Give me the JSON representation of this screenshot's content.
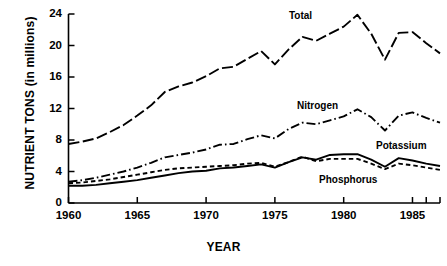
{
  "chart_data": {
    "type": "line",
    "title": "",
    "xlabel": "YEAR",
    "ylabel": "NUTRIENT TONS (in millions)",
    "xlim": [
      1960,
      1987
    ],
    "ylim": [
      0,
      24
    ],
    "xticks": [
      1960,
      1965,
      1970,
      1975,
      1980,
      1985
    ],
    "yticks": [
      0,
      4,
      8,
      12,
      16,
      20,
      24
    ],
    "grid": false,
    "legend": "inline-annotations",
    "x": [
      1960,
      1961,
      1962,
      1963,
      1964,
      1965,
      1966,
      1967,
      1968,
      1969,
      1970,
      1971,
      1972,
      1973,
      1974,
      1975,
      1976,
      1977,
      1978,
      1979,
      1980,
      1981,
      1982,
      1983,
      1984,
      1985,
      1986,
      1987
    ],
    "series": [
      {
        "name": "Total",
        "style": "long-dash",
        "values": [
          7.5,
          7.8,
          8.2,
          9.0,
          9.9,
          11.1,
          12.4,
          14.1,
          14.8,
          15.3,
          16.1,
          17.1,
          17.3,
          18.3,
          19.3,
          17.6,
          19.5,
          21.1,
          20.6,
          21.5,
          22.4,
          23.9,
          21.5,
          18.2,
          21.6,
          21.7,
          20.3,
          19.0
        ]
      },
      {
        "name": "Nitrogen",
        "style": "dash-dot",
        "values": [
          2.7,
          2.9,
          3.2,
          3.6,
          4.0,
          4.5,
          5.1,
          5.8,
          6.1,
          6.4,
          6.8,
          7.4,
          7.5,
          8.1,
          8.6,
          8.2,
          9.4,
          10.2,
          10.0,
          10.5,
          11.0,
          11.9,
          10.9,
          9.2,
          11.1,
          11.5,
          10.8,
          10.2
        ]
      },
      {
        "name": "Potassium",
        "style": "solid",
        "values": [
          2.2,
          2.2,
          2.3,
          2.5,
          2.7,
          2.9,
          3.2,
          3.5,
          3.8,
          4.0,
          4.1,
          4.4,
          4.5,
          4.7,
          4.9,
          4.5,
          5.2,
          5.8,
          5.5,
          6.1,
          6.2,
          6.2,
          5.5,
          4.6,
          5.7,
          5.4,
          5.0,
          4.7
        ]
      },
      {
        "name": "Phosphorus",
        "style": "short-dash",
        "values": [
          2.5,
          2.6,
          2.8,
          3.0,
          3.3,
          3.6,
          3.9,
          4.2,
          4.4,
          4.5,
          4.6,
          4.7,
          4.8,
          5.0,
          5.1,
          4.6,
          5.2,
          5.9,
          5.3,
          5.6,
          5.6,
          5.6,
          5.0,
          4.3,
          5.0,
          4.8,
          4.5,
          4.2
        ]
      }
    ],
    "annotations": [
      {
        "text": "Total",
        "x": 288,
        "y": 10
      },
      {
        "text": "Nitrogen",
        "x": 296,
        "y": 100
      },
      {
        "text": "Potassium",
        "x": 375,
        "y": 140
      },
      {
        "text": "Phosphorus",
        "x": 318,
        "y": 174
      }
    ],
    "colors": {
      "line": "#000000",
      "axis": "#000000",
      "background": "#ffffff"
    }
  },
  "axes": {
    "y_title": "NUTRIENT TONS (in millions)",
    "x_title": "YEAR",
    "y_tick_labels": [
      "24",
      "20",
      "16",
      "12",
      "8",
      "4",
      "0"
    ],
    "x_tick_labels": [
      "1960",
      "1965",
      "1970",
      "1975",
      "1980",
      "1985"
    ]
  },
  "labels": {
    "total": "Total",
    "nitrogen": "Nitrogen",
    "potassium": "Potassium",
    "phosphorus": "Phosphorus"
  }
}
